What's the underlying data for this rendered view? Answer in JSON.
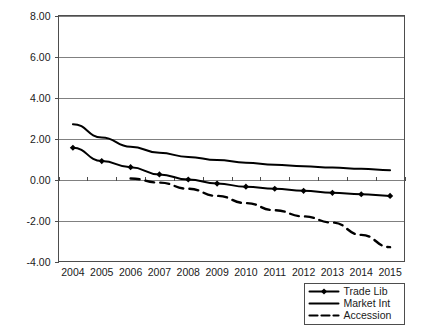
{
  "chart_data": {
    "type": "line",
    "title": "",
    "subtitle": "",
    "xlabel": "",
    "ylabel": "",
    "categories": [
      "2004",
      "2005",
      "2006",
      "2007",
      "2008",
      "2009",
      "2010",
      "2011",
      "2012",
      "2013",
      "2014",
      "2015"
    ],
    "ylim": [
      -4.0,
      8.0
    ],
    "ytick_labels": [
      "8.00",
      "6.00",
      "4.00",
      "2.00",
      "0.00",
      "-2.00",
      "-4.00"
    ],
    "ytick_values": [
      8.0,
      6.0,
      4.0,
      2.0,
      0.0,
      -2.0,
      -4.0
    ],
    "grid": true,
    "legend_position": "bottom-right",
    "series": [
      {
        "name": "Trade Lib",
        "style": "solid-with-markers",
        "marker": "diamond",
        "values": [
          1.55,
          0.9,
          0.6,
          0.25,
          0.0,
          -0.2,
          -0.35,
          -0.45,
          -0.55,
          -0.65,
          -0.72,
          -0.8
        ]
      },
      {
        "name": "Market Int",
        "style": "solid",
        "marker": "none",
        "values": [
          2.7,
          2.05,
          1.6,
          1.3,
          1.1,
          0.95,
          0.82,
          0.72,
          0.65,
          0.58,
          0.52,
          0.45
        ]
      },
      {
        "name": "Accession",
        "style": "dashed",
        "marker": "none",
        "values": [
          null,
          null,
          0.05,
          -0.15,
          -0.45,
          -0.8,
          -1.15,
          -1.5,
          -1.8,
          -2.1,
          -2.7,
          -3.3
        ]
      }
    ]
  },
  "legend": {
    "entries": [
      {
        "label": "Trade Lib"
      },
      {
        "label": "Market Int"
      },
      {
        "label": "Accession"
      }
    ]
  },
  "colors": {
    "series_line": "#000000",
    "grid": "#808080",
    "frame": "#4d4d4d",
    "text": "#1a1a1a",
    "background": "#ffffff"
  }
}
